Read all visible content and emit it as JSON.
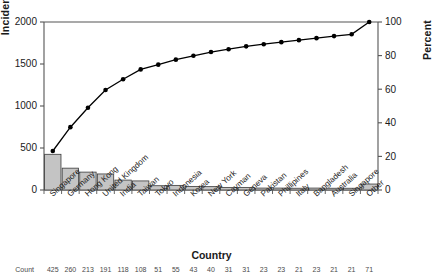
{
  "chart_data": {
    "type": "bar",
    "title": "",
    "xlabel": "Country",
    "ylabel": "Incident count",
    "y2label": "Percent",
    "ylim": [
      0,
      2000
    ],
    "y2lim": [
      0,
      100
    ],
    "yticks": [
      0,
      500,
      1000,
      1500,
      2000
    ],
    "y2ticks": [
      0,
      20,
      40,
      60,
      80,
      100
    ],
    "grid": false,
    "legend": false,
    "categories": [
      "Singapore",
      "Germany",
      "Hong Kong",
      "United Kingdom",
      "India",
      "Taiwan",
      "Tokyo",
      "Indonesia",
      "Korea",
      "New York",
      "Cayman",
      "Geneva",
      "Pakistan",
      "Phillipines",
      "Italy",
      "Bangladesh",
      "Australia",
      "Singapore",
      "Other"
    ],
    "series": [
      {
        "name": "Incident count",
        "type": "bar",
        "values": [
          425,
          260,
          213,
          191,
          118,
          108,
          51,
          55,
          43,
          40,
          31,
          31,
          23,
          23,
          21,
          23,
          21,
          21,
          71
        ]
      },
      {
        "name": "Cumulative percent",
        "type": "line",
        "values": [
          23.2,
          37.4,
          49.0,
          59.5,
          65.9,
          71.8,
          74.6,
          77.6,
          79.9,
          82.1,
          83.8,
          85.5,
          86.8,
          88.0,
          89.2,
          90.4,
          91.6,
          92.7,
          100.0
        ]
      }
    ],
    "count_row": [
      425,
      260,
      213,
      191,
      118,
      108,
      51,
      55,
      43,
      40,
      31,
      31,
      23,
      23,
      21,
      23,
      21,
      21,
      71
    ],
    "count_row_label": "Count"
  },
  "axes": {
    "left_title": "Incident count",
    "right_title": "Percent",
    "bottom_title": "Country"
  },
  "colors": {
    "bar_fill": "#c4c4c4",
    "bar_stroke": "#3a3a3a",
    "line": "#000000",
    "axis": "#555555",
    "text": "#1a1a1a"
  }
}
